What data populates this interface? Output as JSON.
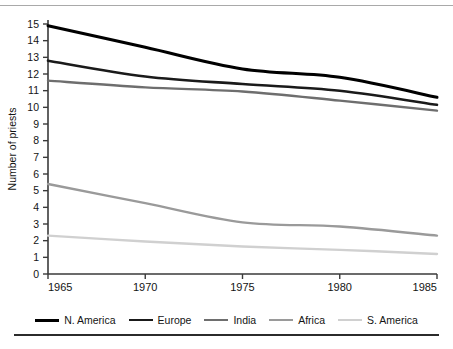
{
  "figure": {
    "rule_top": "horizontal-rule",
    "rule_bottom": "horizontal-rule"
  },
  "chart_data": {
    "type": "line",
    "title": "",
    "xlabel": "",
    "ylabel": "Number of priests",
    "x": [
      1965,
      1970,
      1975,
      1980,
      1985
    ],
    "xtick_labels": [
      "1965",
      "1970",
      "1975",
      "1980",
      "1985"
    ],
    "xlim": [
      1965,
      1985
    ],
    "ylim": [
      0,
      15
    ],
    "ytick_labels": [
      "0",
      "1",
      "2",
      "3",
      "4",
      "5",
      "6",
      "7",
      "8",
      "9",
      "10",
      "11",
      "12",
      "13",
      "14",
      "15"
    ],
    "ytick_values": [
      0,
      1,
      2,
      3,
      4,
      5,
      6,
      7,
      8,
      9,
      10,
      11,
      12,
      13,
      14,
      15
    ],
    "grid": false,
    "legend_position": "bottom",
    "series": [
      {
        "name": "N. America",
        "color": "#000000",
        "width": 3.0,
        "values": [
          14.9,
          13.6,
          12.3,
          11.8,
          10.6
        ]
      },
      {
        "name": "Europe",
        "color": "#1a1a1a",
        "width": 2.6,
        "values": [
          12.8,
          11.85,
          11.4,
          11.0,
          10.15
        ]
      },
      {
        "name": "India",
        "color": "#6e6e6e",
        "width": 2.4,
        "values": [
          11.6,
          11.2,
          10.95,
          10.4,
          9.8
        ]
      },
      {
        "name": "Africa",
        "color": "#9a9a9a",
        "width": 2.4,
        "values": [
          5.4,
          4.25,
          3.1,
          2.85,
          2.3
        ]
      },
      {
        "name": "S. America",
        "color": "#d0d0d0",
        "width": 2.4,
        "values": [
          2.3,
          1.95,
          1.65,
          1.45,
          1.2
        ]
      }
    ]
  }
}
